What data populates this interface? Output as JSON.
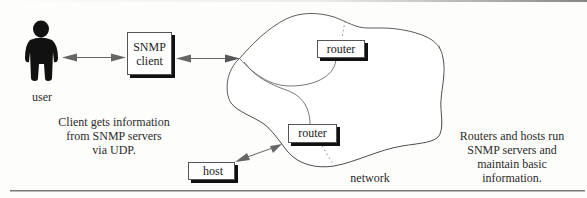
{
  "figure": {
    "user": {
      "label": "user",
      "icon": "person-silhouette-icon"
    },
    "snmp_client": {
      "line1": "SNMP",
      "line2": "client"
    },
    "routers": [
      {
        "label": "router"
      },
      {
        "label": "router"
      }
    ],
    "host": {
      "label": "host"
    },
    "network": {
      "label": "network"
    },
    "captions": {
      "left": [
        "Client gets information",
        "from SNMP servers",
        "via UDP."
      ],
      "right": [
        "Routers and hosts run",
        "SNMP servers and",
        "maintain basic",
        "information."
      ]
    },
    "colors": {
      "background": "#fdfdfb",
      "ink": "#111111",
      "arrow": "#777777",
      "rule": "#888888"
    }
  }
}
